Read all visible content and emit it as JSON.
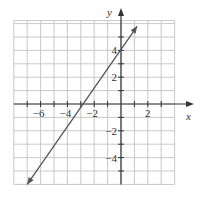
{
  "chart_data": {
    "type": "line",
    "title": "",
    "xlabel": "x",
    "ylabel": "y",
    "xlim": [
      -8,
      4
    ],
    "ylim": [
      -6,
      6
    ],
    "grid": true,
    "x_ticks": [
      -6,
      -4,
      -2,
      2
    ],
    "y_ticks": [
      4,
      2,
      -2,
      -4
    ],
    "x_tick_labels": [
      "−6",
      "−4",
      "−2",
      "2"
    ],
    "y_tick_labels": [
      "4",
      "2",
      "−2",
      "−4"
    ],
    "series": [
      {
        "name": "line",
        "equation": "y = 1.5x + 4",
        "slope": 1.5,
        "y_intercept": 4,
        "x_intercept": -2.67,
        "x": [
          -7.0,
          1.2
        ],
        "y": [
          -6.0,
          5.8
        ],
        "arrows": "both"
      }
    ],
    "colors": {
      "grid": "#c8c8c8",
      "axis": "#333333",
      "line": "#555555"
    }
  }
}
